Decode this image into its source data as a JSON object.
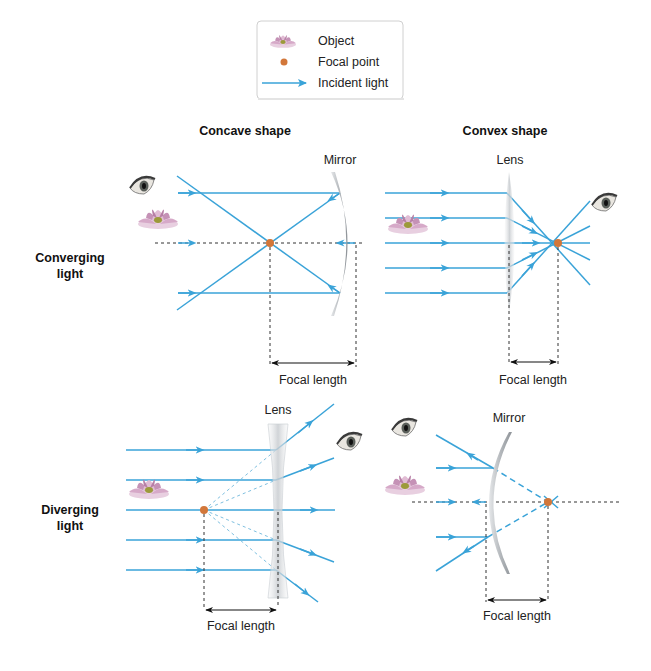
{
  "legend": {
    "items": [
      {
        "icon": "lotus-flower-icon",
        "label": "Object"
      },
      {
        "icon": "focal-point-dot-icon",
        "label": "Focal point"
      },
      {
        "icon": "arrow-right-icon",
        "label": "Incident light"
      }
    ]
  },
  "columns": {
    "left": "Concave shape",
    "right": "Convex shape"
  },
  "rows": {
    "top": [
      "Converging",
      "light"
    ],
    "bottom": [
      "Diverging",
      "light"
    ]
  },
  "panels": {
    "concave_mirror": {
      "element_label": "Mirror",
      "dimension_label": "Focal length"
    },
    "convex_lens": {
      "element_label": "Lens",
      "dimension_label": "Focal length"
    },
    "concave_lens": {
      "element_label": "Lens",
      "dimension_label": "Focal length"
    },
    "convex_mirror": {
      "element_label": "Mirror",
      "dimension_label": "Focal length"
    }
  },
  "colors": {
    "ray": "#3aa3d8",
    "focal_point": "#d2773a",
    "background": "#ffffff"
  }
}
